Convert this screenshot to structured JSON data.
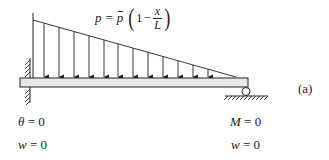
{
  "diagram": {
    "load_formula": {
      "lhs": "p",
      "equals": "=",
      "pbar": "p",
      "open_paren": "(",
      "one": "1",
      "minus": "−",
      "numerator": "x",
      "denominator": "L",
      "close_paren": ")"
    },
    "label": "(a)",
    "left_support": {
      "type": "fixed",
      "conditions": [
        {
          "var": "θ",
          "eq": "= 0"
        },
        {
          "var": "w",
          "eq": "= 0"
        }
      ]
    },
    "right_support": {
      "type": "roller",
      "conditions": [
        {
          "var": "M",
          "eq": "= 0"
        },
        {
          "var": "w",
          "eq": "= 0"
        }
      ]
    },
    "load": {
      "type": "linearly-decreasing distributed load",
      "arrow_count": 13
    },
    "colors": {
      "line": "#222222",
      "beam_fill": "#e8e8e8"
    }
  }
}
